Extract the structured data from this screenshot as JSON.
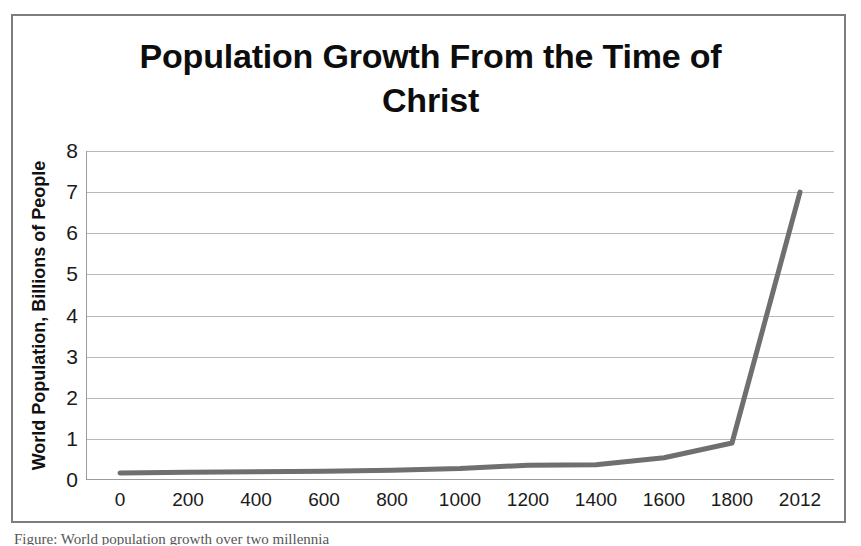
{
  "chart_data": {
    "type": "line",
    "title": "Population Growth From the Time of Christ",
    "title_line1": "Population Growth From the Time of",
    "title_line2": "Christ",
    "xlabel": "",
    "ylabel": "World Population, Billions of People",
    "categories": [
      "0",
      "200",
      "400",
      "600",
      "800",
      "1000",
      "1200",
      "1400",
      "1600",
      "1800",
      "2012"
    ],
    "values": [
      0.17,
      0.19,
      0.2,
      0.21,
      0.24,
      0.28,
      0.36,
      0.37,
      0.54,
      0.9,
      7.0
    ],
    "ytick_labels": [
      "0",
      "1",
      "2",
      "3",
      "4",
      "5",
      "6",
      "7",
      "8"
    ],
    "ytick_values": [
      0,
      1,
      2,
      3,
      4,
      5,
      6,
      7,
      8
    ],
    "ylim": [
      0,
      8
    ],
    "grid": "horizontal",
    "legend": "none",
    "series_color": "#6f6f6f",
    "gridline_color": "#b9b9b9",
    "axis_color": "#9b9b9b",
    "text_color": "#1a1a1a",
    "frame_color": "#7d7d7d"
  },
  "caption": {
    "text": "Figure: World population growth over two millennia"
  }
}
